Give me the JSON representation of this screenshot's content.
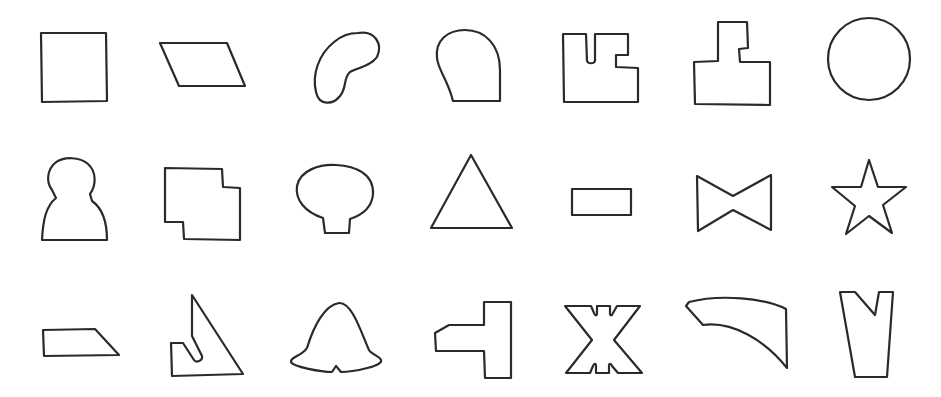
{
  "figure": {
    "stroke_color": "#2a2a2a",
    "background": "#ffffff",
    "rows": [
      {
        "row": 1,
        "shapes": [
          "square",
          "parallelogram",
          "kidney-blob",
          "rounded-quarter-dome",
          "notched-block",
          "stepped-tower-block",
          "circle"
        ]
      },
      {
        "row": 2,
        "shapes": [
          "pawn-silhouette",
          "offset-overlapping-squares",
          "mushroom-oval",
          "triangle",
          "small-rectangle",
          "bowtie",
          "five-point-star"
        ]
      },
      {
        "row": 3,
        "shapes": [
          "trapezoid-slab",
          "notched-right-triangle",
          "bell",
          "t-bracket",
          "x-letter-block",
          "curved-horn",
          "v-notched-tapered-post"
        ]
      }
    ]
  }
}
